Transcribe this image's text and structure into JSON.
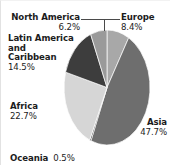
{
  "chart_data": {
    "type": "pie",
    "title": "",
    "subtitle": "",
    "xlabel": "",
    "ylabel": "",
    "legend_position": "none",
    "grid": false,
    "labels_on_slices": false,
    "total_percent": 100.0,
    "categories": [
      "Europe",
      "Asia",
      "Oceania",
      "Africa",
      "Latin America and Caribbean",
      "North America"
    ],
    "values": [
      8.4,
      47.7,
      0.5,
      22.7,
      14.5,
      6.2
    ],
    "slices": [
      {
        "name": "Europe",
        "label_lines": [
          "Europe"
        ],
        "value": 8.4,
        "percent_text": "8.4%",
        "color": "#a8a8a8",
        "start_angle": 0.0,
        "end_angle": 30.24,
        "label_position": "top-right",
        "has_leader_line": true
      },
      {
        "name": "Asia",
        "label_lines": [
          "Asia"
        ],
        "value": 47.7,
        "percent_text": "47.7%",
        "color": "#6e6e6e",
        "start_angle": 30.24,
        "end_angle": 201.96,
        "label_position": "bottom-right",
        "has_leader_line": false
      },
      {
        "name": "Oceania",
        "label_lines": [
          "Oceania"
        ],
        "value": 0.5,
        "percent_text": "0.5%",
        "color": "#2e2e2e",
        "start_angle": 201.96,
        "end_angle": 203.76,
        "label_position": "bottom-left",
        "has_leader_line": false
      },
      {
        "name": "Africa",
        "label_lines": [
          "Africa"
        ],
        "value": 22.7,
        "percent_text": "22.7%",
        "color": "#d6d6d6",
        "start_angle": 203.76,
        "end_angle": 285.48,
        "label_position": "left",
        "has_leader_line": false
      },
      {
        "name": "Latin America and Caribbean",
        "label_lines": [
          "Latin America",
          "and",
          "Caribbean"
        ],
        "value": 14.5,
        "percent_text": "14.5%",
        "color": "#3d3d3d",
        "start_angle": 285.48,
        "end_angle": 337.68,
        "label_position": "top-left",
        "has_leader_line": false
      },
      {
        "name": "North America",
        "label_lines": [
          "North America"
        ],
        "value": 6.2,
        "percent_text": "6.2%",
        "color": "#9a9a9a",
        "start_angle": 337.68,
        "end_angle": 360.0,
        "label_position": "top",
        "has_leader_line": true
      }
    ]
  },
  "labels": {
    "north_america": {
      "name": "North America",
      "percent": "6.2%"
    },
    "latin_america": {
      "line1": "Latin America",
      "line2": "and",
      "line3": "Caribbean",
      "percent": "14.5%"
    },
    "africa": {
      "name": "Africa",
      "percent": "22.7%"
    },
    "oceania": {
      "name": "Oceania",
      "percent": "0.5%"
    },
    "europe": {
      "name": "Europe",
      "percent": "8.4%"
    },
    "asia": {
      "name": "Asia",
      "percent": "47.7%"
    }
  },
  "colors": {
    "background": "#ffffff",
    "text": "#1c1c1c",
    "leader_line": "#4a4a4a",
    "border": "#e2e2e2",
    "europe": "#a8a8a8",
    "asia": "#6e6e6e",
    "oceania": "#2e2e2e",
    "africa": "#d6d6d6",
    "latin_america": "#3d3d3d",
    "north_america": "#9a9a9a"
  }
}
